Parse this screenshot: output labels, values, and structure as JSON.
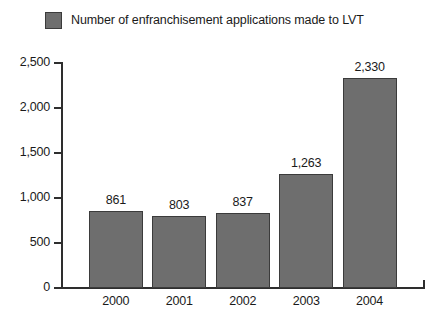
{
  "legend": {
    "label": "Number of enfranchisement applications made to LVT",
    "swatch_color": "#6e6e6e",
    "swatch_border_color": "#3b3b3b",
    "position": "top-left"
  },
  "colors": {
    "bar_fill": "#6e6e6e",
    "bar_outline": "#3b3b3b",
    "axis": "#2e2e2e",
    "text": "#1a1a1a",
    "background": "#ffffff"
  },
  "chart_data": {
    "type": "bar",
    "title": "",
    "subtitle": "",
    "xlabel": "",
    "ylabel": "",
    "categories": [
      "2000",
      "2001",
      "2002",
      "2003",
      "2004"
    ],
    "values": [
      861,
      803,
      837,
      1263,
      2330
    ],
    "value_labels": [
      "861",
      "803",
      "837",
      "1,263",
      "2,330"
    ],
    "series": [
      {
        "name": "Number of enfranchisement applications made to LVT",
        "values": [
          861,
          803,
          837,
          1263,
          2330
        ]
      }
    ],
    "ylim": [
      0,
      2500
    ],
    "ytick_values": [
      0,
      500,
      1000,
      1500,
      2000,
      2500
    ],
    "ytick_labels": [
      "0",
      "500",
      "1,000",
      "1,500",
      "2,000",
      "2,500"
    ],
    "grid": false,
    "legend_position": "top-left",
    "data_labels": true
  }
}
